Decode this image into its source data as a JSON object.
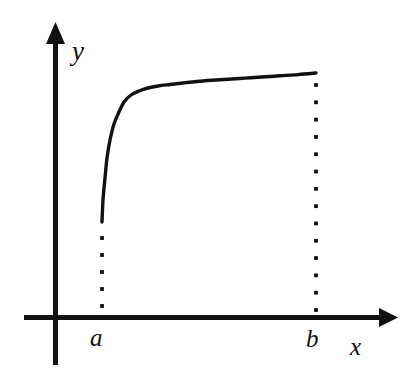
{
  "figure": {
    "title": "",
    "background_color": "#ffffff",
    "ink_color": "#111111",
    "width": 411,
    "height": 373
  },
  "labels": {
    "y_axis": "y",
    "x_axis": "x",
    "left_bound": "a",
    "right_bound": "b"
  },
  "chart_data": {
    "type": "line",
    "title": "",
    "xlabel": "x",
    "ylabel": "y",
    "grid": false,
    "legend": "none",
    "axis_style": "arrowed-cartesian",
    "annotations": [
      {
        "name": "left-bound-tick",
        "label": "a",
        "x": 102,
        "kind": "x-axis-bound"
      },
      {
        "name": "right-bound-tick",
        "label": "b",
        "x": 316,
        "kind": "x-axis-bound"
      },
      {
        "name": "left-dotted-drop",
        "label": "",
        "kind": "dotted-vertical",
        "x": 102,
        "y_top": 238,
        "y_bottom": 306,
        "dots": 5
      },
      {
        "name": "right-dotted-drop",
        "label": "",
        "kind": "dotted-vertical",
        "x": 316,
        "y_top": 85,
        "y_bottom": 310,
        "dots": 14
      }
    ],
    "axes_px": {
      "y_axis_x": 55,
      "y_axis_top": 22,
      "y_axis_bottom": 365,
      "x_axis_y": 317,
      "x_axis_left": 24,
      "x_axis_right": 398
    },
    "series": [
      {
        "name": "curve",
        "shape": "increasing-concave-down",
        "x": [
          102,
          103,
          105,
          107,
          110,
          114,
          119,
          124,
          131,
          139,
          148,
          158,
          170,
          183,
          197,
          212,
          228,
          245,
          262,
          280,
          298,
          316
        ],
        "y": [
          222,
          200,
          178,
          158,
          140,
          124,
          112,
          102,
          95,
          91,
          88,
          86,
          84.5,
          83,
          81.5,
          80.3,
          79.2,
          78.1,
          77.0,
          75.8,
          74.6,
          73
        ]
      }
    ],
    "curve_endpoints": {
      "start": {
        "x_px": 102,
        "y_px": 222,
        "x_label": "a"
      },
      "end": {
        "x_px": 316,
        "y_px": 73,
        "x_label": "b"
      }
    }
  }
}
